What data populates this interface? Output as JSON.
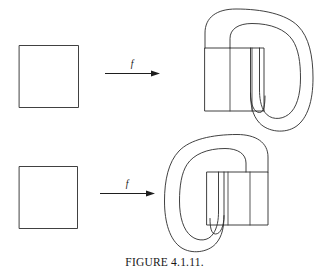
{
  "figure": {
    "caption": "FIGURE 4.1.11.",
    "background_color": "#ffffff",
    "ink_color": "#2b2b2b",
    "width": 329,
    "height": 279
  },
  "rows": [
    {
      "id": "row-top",
      "domain_square": {
        "label": "",
        "x": 19,
        "y": 45,
        "width": 59,
        "height": 62
      },
      "map_arrow": {
        "label": "f",
        "x1": 105,
        "x2": 157,
        "y": 73
      },
      "image_figure": {
        "kind": "horseshoe-fold-right",
        "rectangle": {
          "x": 205,
          "y": 48,
          "width": 59,
          "height": 63
        },
        "divider_x": [
          230,
          252
        ]
      }
    },
    {
      "id": "row-bottom",
      "domain_square": {
        "label": "",
        "x": 19,
        "y": 166,
        "width": 58,
        "height": 62
      },
      "map_arrow": {
        "label": "f",
        "x1": 100,
        "x2": 152,
        "y": 193
      },
      "image_figure": {
        "kind": "horseshoe-fold-left",
        "rectangle": {
          "x": 207,
          "y": 172,
          "width": 61,
          "height": 53
        },
        "divider_x": [
          228,
          250
        ]
      }
    }
  ]
}
